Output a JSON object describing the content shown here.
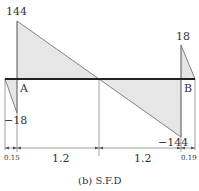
{
  "diagram": {
    "caption": "(b) S.F.D",
    "colors": {
      "fill": "#e6e6e6",
      "stroke": "#555555",
      "baseline": "#222222",
      "text": "#333333"
    },
    "supports": {
      "left": "A",
      "right": "B"
    },
    "values": {
      "left_peak": "144",
      "left_neg": "−18",
      "right_neg": "−144",
      "right_peak": "18"
    },
    "dimensions": [
      "0.15",
      "1.2",
      "1.2",
      "0.19"
    ]
  }
}
